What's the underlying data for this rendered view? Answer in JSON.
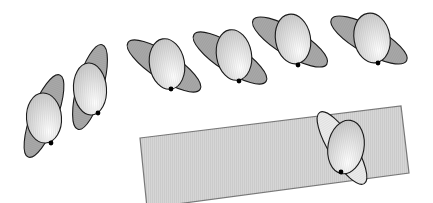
{
  "diagram": {
    "width": 433,
    "height": 203,
    "colors": {
      "background": "#ffffff",
      "outline": "#1a1a1a",
      "back_ellipse": "#a9a9a9",
      "back_ellipse_light": "#ececec",
      "front_ellipse_light": "#ffffff",
      "front_ellipse_shade": "#c8c8c8",
      "plane_fill": "#d6d6d6",
      "plane_stroke": "#7a7a7a",
      "contact_dot": "#000000"
    },
    "plane": {
      "points": [
        [
          140,
          138
        ],
        [
          401,
          106
        ],
        [
          409,
          173
        ],
        [
          147,
          208
        ]
      ]
    },
    "figures": [
      {
        "id": "figure-1",
        "back": {
          "cx": 44,
          "cy": 116,
          "rx": 44,
          "ry": 13,
          "angle": -69,
          "variant": "dark"
        },
        "front": {
          "cx": 44,
          "cy": 118,
          "rx": 17.5,
          "ry": 25,
          "angle": -4
        },
        "dot": {
          "x": 51,
          "y": 143
        }
      },
      {
        "id": "figure-2",
        "back": {
          "cx": 90,
          "cy": 87,
          "rx": 44,
          "ry": 13,
          "angle": -74,
          "variant": "dark"
        },
        "front": {
          "cx": 90,
          "cy": 89,
          "rx": 16.5,
          "ry": 26,
          "angle": -4
        },
        "dot": {
          "x": 98,
          "y": 113
        }
      },
      {
        "id": "figure-3",
        "back": {
          "cx": 164,
          "cy": 66,
          "rx": 43,
          "ry": 13.5,
          "angle": 33,
          "variant": "dark"
        },
        "front": {
          "cx": 167,
          "cy": 64,
          "rx": 17.5,
          "ry": 25.5,
          "angle": -10
        },
        "dot": {
          "x": 171,
          "y": 89
        }
      },
      {
        "id": "figure-4",
        "back": {
          "cx": 230,
          "cy": 58,
          "rx": 43,
          "ry": 13.5,
          "angle": 33,
          "variant": "dark"
        },
        "front": {
          "cx": 234,
          "cy": 55,
          "rx": 17.5,
          "ry": 25.5,
          "angle": -10
        },
        "dot": {
          "x": 239,
          "y": 81
        }
      },
      {
        "id": "figure-5",
        "back": {
          "cx": 290,
          "cy": 42,
          "rx": 43,
          "ry": 13.5,
          "angle": 31,
          "variant": "dark"
        },
        "front": {
          "cx": 293,
          "cy": 39,
          "rx": 17.5,
          "ry": 25,
          "angle": -10
        },
        "dot": {
          "x": 298,
          "y": 65
        }
      },
      {
        "id": "figure-6",
        "back": {
          "cx": 369,
          "cy": 40,
          "rx": 43,
          "ry": 13.5,
          "angle": 29,
          "variant": "dark"
        },
        "front": {
          "cx": 372,
          "cy": 38,
          "rx": 18,
          "ry": 25,
          "angle": -10
        },
        "dot": {
          "x": 378,
          "y": 63
        }
      },
      {
        "id": "figure-7-on-plane",
        "back": {
          "cx": 342,
          "cy": 148,
          "rx": 42,
          "ry": 13,
          "angle": 58,
          "variant": "light"
        },
        "front": {
          "cx": 346,
          "cy": 147,
          "rx": 18,
          "ry": 27,
          "angle": 10
        },
        "dot": {
          "x": 341,
          "y": 172
        }
      }
    ]
  }
}
